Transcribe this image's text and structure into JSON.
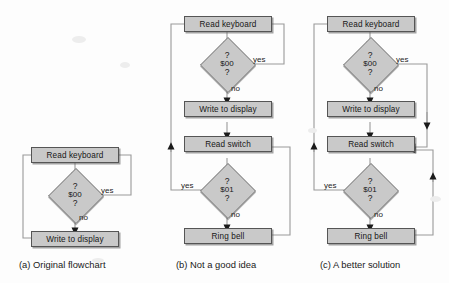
{
  "figure": {
    "background_color": "#fdfdfd",
    "node_fill": "#c9c9c9",
    "node_stroke": "#555555",
    "wire_color": "#9a9a9a",
    "arrow_color": "#1b1b1b"
  },
  "panels": [
    {
      "id": "a",
      "caption": "(a) Original flowchart",
      "nodes": [
        {
          "name": "read-keyboard",
          "label": "Read keyboard",
          "shape": "process"
        },
        {
          "name": "test-00",
          "label": "$00",
          "question": "?",
          "shape": "decision"
        },
        {
          "name": "write-to-display",
          "label": "Write to display",
          "shape": "process"
        }
      ],
      "edge_labels": [
        "yes",
        "no"
      ]
    },
    {
      "id": "b",
      "caption": "(b) Not a good idea",
      "nodes": [
        {
          "name": "read-keyboard",
          "label": "Read keyboard",
          "shape": "process"
        },
        {
          "name": "test-00",
          "label": "$00",
          "question": "?",
          "shape": "decision"
        },
        {
          "name": "write-to-display",
          "label": "Write to display",
          "shape": "process"
        },
        {
          "name": "read-switch",
          "label": "Read switch",
          "shape": "process"
        },
        {
          "name": "test-01",
          "label": "$01",
          "question": "?",
          "shape": "decision"
        },
        {
          "name": "ring-bell",
          "label": "Ring bell",
          "shape": "process"
        }
      ],
      "edge_labels": [
        "yes",
        "no",
        "yes",
        "no"
      ]
    },
    {
      "id": "c",
      "caption": "(c) A better solution",
      "nodes": [
        {
          "name": "read-keyboard",
          "label": "Read keyboard",
          "shape": "process"
        },
        {
          "name": "test-00",
          "label": "$00",
          "question": "?",
          "shape": "decision"
        },
        {
          "name": "write-to-display",
          "label": "Write to display",
          "shape": "process"
        },
        {
          "name": "read-switch",
          "label": "Read switch",
          "shape": "process"
        },
        {
          "name": "test-01",
          "label": "$01",
          "question": "?",
          "shape": "decision"
        },
        {
          "name": "ring-bell",
          "label": "Ring bell",
          "shape": "process"
        }
      ],
      "edge_labels": [
        "yes",
        "no",
        "yes",
        "no"
      ]
    }
  ]
}
